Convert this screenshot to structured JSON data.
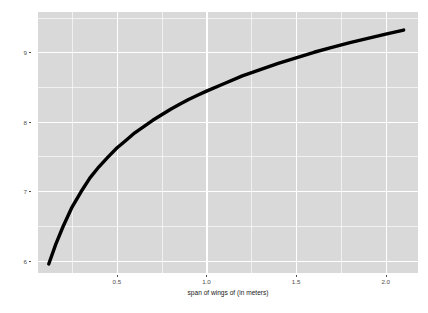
{
  "chart_data": {
    "type": "line",
    "title": "",
    "xlabel": "span of wings of (in meters)",
    "ylabel": "speed of dragon (in km/hour)",
    "xlim": [
      0.06,
      2.18
    ],
    "ylim": [
      5.82,
      9.58
    ],
    "xticks": [
      "0.5",
      "1.0",
      "1.5",
      "2.0"
    ],
    "xtick_values": [
      0.5,
      1.0,
      1.5,
      2.0
    ],
    "yticks": [
      "9",
      "8",
      "7",
      "6"
    ],
    "ytick_values": [
      9,
      8,
      7,
      6
    ],
    "x_minor_values": [
      0.25,
      0.75,
      1.25,
      1.75
    ],
    "y_minor_values": [
      9.5,
      8.5,
      7.5,
      6.5
    ],
    "grid": true,
    "legend": "none",
    "panel_background": "#d9d9d9",
    "grid_color": "#ffffff",
    "line_color": "#000000",
    "line_width": 3.4,
    "series": [
      {
        "name": "speed of dragon",
        "x": [
          0.12,
          0.16,
          0.2,
          0.25,
          0.3,
          0.35,
          0.4,
          0.45,
          0.5,
          0.55,
          0.6,
          0.65,
          0.7,
          0.75,
          0.8,
          0.85,
          0.9,
          0.95,
          1.0,
          1.1,
          1.2,
          1.3,
          1.4,
          1.5,
          1.6,
          1.7,
          1.8,
          1.9,
          2.0,
          2.1
        ],
        "y": [
          5.95,
          6.24,
          6.49,
          6.77,
          6.99,
          7.19,
          7.35,
          7.49,
          7.62,
          7.73,
          7.84,
          7.93,
          8.02,
          8.1,
          8.18,
          8.25,
          8.32,
          8.38,
          8.44,
          8.55,
          8.66,
          8.75,
          8.84,
          8.92,
          9.0,
          9.07,
          9.14,
          9.2,
          9.26,
          9.32
        ]
      }
    ]
  }
}
